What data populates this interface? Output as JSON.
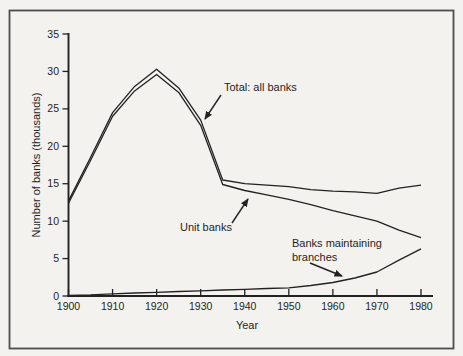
{
  "figure": {
    "background": "#f4f2ee",
    "frame_color": "#4d4d4d",
    "ink_color": "#222222"
  },
  "axes": {
    "ylabel": "Number of banks (thousands)",
    "xlabel": "Year"
  },
  "annotations": {
    "total_label": "Total: all banks",
    "unit_label": "Unit banks",
    "branches_label_line1": "Banks maintaining",
    "branches_label_line2": "branches"
  },
  "chart_data": {
    "type": "line",
    "title": "",
    "xlabel": "Year",
    "ylabel": "Number of banks (thousands)",
    "xlim": [
      1900,
      1980
    ],
    "ylim": [
      0,
      35
    ],
    "x_ticks": [
      1900,
      1910,
      1920,
      1930,
      1940,
      1950,
      1960,
      1970,
      1980
    ],
    "y_ticks": [
      0,
      5,
      10,
      15,
      20,
      25,
      30,
      35
    ],
    "grid": false,
    "legend": "inline arrow annotations",
    "line_color": "#222222",
    "x": [
      1900,
      1905,
      1910,
      1915,
      1920,
      1925,
      1930,
      1935,
      1940,
      1945,
      1950,
      1955,
      1960,
      1965,
      1970,
      1975,
      1980
    ],
    "series": [
      {
        "name": "Total: all banks",
        "values": [
          12.7,
          18.5,
          24.5,
          28.0,
          30.3,
          27.8,
          23.5,
          15.5,
          15.0,
          14.8,
          14.6,
          14.2,
          14.0,
          13.9,
          13.7,
          14.4,
          14.8
        ]
      },
      {
        "name": "Unit banks",
        "values": [
          12.4,
          18.1,
          24.0,
          27.4,
          29.6,
          27.2,
          22.8,
          14.9,
          14.1,
          13.5,
          12.9,
          12.2,
          11.4,
          10.7,
          10.0,
          8.8,
          7.8
        ]
      },
      {
        "name": "Banks maintaining branches",
        "values": [
          0.1,
          0.15,
          0.3,
          0.4,
          0.5,
          0.6,
          0.7,
          0.8,
          0.9,
          1.0,
          1.1,
          1.4,
          1.8,
          2.4,
          3.2,
          4.8,
          6.3
        ]
      }
    ]
  }
}
